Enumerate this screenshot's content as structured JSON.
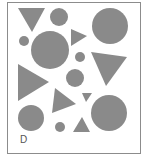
{
  "figure": {
    "label": "D",
    "frame": {
      "x": 7,
      "y": 2,
      "width": 133,
      "height": 151,
      "stroke": "#8c8c8c"
    },
    "fill_color": "#8a8a8a",
    "background": "#ffffff",
    "circles": [
      {
        "name": "circle-top-small",
        "cx": 59,
        "cy": 17,
        "r": 9
      },
      {
        "name": "circle-top-right-large",
        "cx": 110,
        "cy": 26,
        "r": 18
      },
      {
        "name": "circle-left-tiny",
        "cx": 24,
        "cy": 41,
        "r": 5
      },
      {
        "name": "circle-center-large",
        "cx": 50,
        "cy": 50,
        "r": 19
      },
      {
        "name": "circle-center-right-tiny",
        "cx": 80,
        "cy": 57,
        "r": 5
      },
      {
        "name": "circle-middle",
        "cx": 75,
        "cy": 78,
        "r": 9
      },
      {
        "name": "circle-bottom-left",
        "cx": 31,
        "cy": 118,
        "r": 13
      },
      {
        "name": "circle-bottom-small",
        "cx": 60,
        "cy": 127,
        "r": 5
      },
      {
        "name": "circle-bottom-right-large",
        "cx": 109,
        "cy": 113,
        "r": 18
      }
    ],
    "triangles": [
      {
        "name": "triangle-top-left-down",
        "points": "18,8 45,8 32,32"
      },
      {
        "name": "triangle-small-right",
        "points": "71,29 71,46 87,36"
      },
      {
        "name": "triangle-right-down",
        "points": "91,52 127,57 106,86"
      },
      {
        "name": "triangle-left-large-right",
        "points": "18,64 18,101 49,82"
      },
      {
        "name": "triangle-middle",
        "points": "55,88 52,113 76,104"
      },
      {
        "name": "triangle-tiny",
        "points": "82,93 92,93 86,102"
      },
      {
        "name": "triangle-bottom-up",
        "points": "73,132 90,132 82,117"
      }
    ]
  }
}
